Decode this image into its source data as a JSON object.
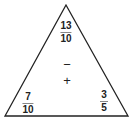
{
  "diagram": {
    "type": "fact-triangle",
    "top": {
      "numerator": "13",
      "denominator": "10"
    },
    "bottom_left": {
      "numerator": "7",
      "denominator": "10"
    },
    "bottom_right": {
      "numerator": "3",
      "denominator": "5"
    },
    "operations": {
      "minus": "−",
      "plus": "+"
    }
  }
}
